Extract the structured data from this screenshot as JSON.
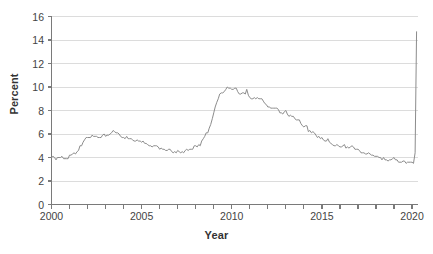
{
  "chart_data": {
    "type": "line",
    "title": "",
    "xlabel": "Year",
    "ylabel": "Percent",
    "xlim": [
      2000,
      2020.33
    ],
    "ylim": [
      0,
      16
    ],
    "ytick_values": [
      0,
      2,
      4,
      6,
      8,
      10,
      12,
      14,
      16
    ],
    "ytick_labels": [
      "0",
      "2",
      "4",
      "6",
      "8",
      "10",
      "12",
      "14",
      "16"
    ],
    "xtick_values": [
      2000,
      2001,
      2002,
      2003,
      2004,
      2005,
      2006,
      2007,
      2008,
      2009,
      2010,
      2011,
      2012,
      2013,
      2014,
      2015,
      2016,
      2017,
      2018,
      2019,
      2020
    ],
    "xtick_labels_shown": [
      "2000",
      "2005",
      "2010",
      "2015",
      "2020"
    ],
    "xtick_labels_shown_values": [
      2000,
      2005,
      2010,
      2015,
      2020
    ],
    "grid": "horizontal",
    "legend": "none",
    "line_color": "#8c8c8c",
    "axis_color": "#7a7a7a",
    "grid_color": "#dcdcdc",
    "series": [
      {
        "name": "Unemployment rate",
        "x": [
          2000.0,
          2000.08,
          2000.17,
          2000.25,
          2000.33,
          2000.42,
          2000.5,
          2000.58,
          2000.67,
          2000.75,
          2000.83,
          2000.92,
          2001.0,
          2001.08,
          2001.17,
          2001.25,
          2001.33,
          2001.42,
          2001.5,
          2001.58,
          2001.67,
          2001.75,
          2001.83,
          2001.92,
          2002.0,
          2002.08,
          2002.17,
          2002.25,
          2002.33,
          2002.42,
          2002.5,
          2002.58,
          2002.67,
          2002.75,
          2002.83,
          2002.92,
          2003.0,
          2003.08,
          2003.17,
          2003.25,
          2003.33,
          2003.42,
          2003.5,
          2003.58,
          2003.67,
          2003.75,
          2003.83,
          2003.92,
          2004.0,
          2004.08,
          2004.17,
          2004.25,
          2004.33,
          2004.42,
          2004.5,
          2004.58,
          2004.67,
          2004.75,
          2004.83,
          2004.92,
          2005.0,
          2005.08,
          2005.17,
          2005.25,
          2005.33,
          2005.42,
          2005.5,
          2005.58,
          2005.67,
          2005.75,
          2005.83,
          2005.92,
          2006.0,
          2006.08,
          2006.17,
          2006.25,
          2006.33,
          2006.42,
          2006.5,
          2006.58,
          2006.67,
          2006.75,
          2006.83,
          2006.92,
          2007.0,
          2007.08,
          2007.17,
          2007.25,
          2007.33,
          2007.42,
          2007.5,
          2007.58,
          2007.67,
          2007.75,
          2007.83,
          2007.92,
          2008.0,
          2008.08,
          2008.17,
          2008.25,
          2008.33,
          2008.42,
          2008.5,
          2008.58,
          2008.67,
          2008.75,
          2008.83,
          2008.92,
          2009.0,
          2009.08,
          2009.17,
          2009.25,
          2009.33,
          2009.42,
          2009.5,
          2009.58,
          2009.67,
          2009.75,
          2009.83,
          2009.92,
          2010.0,
          2010.08,
          2010.17,
          2010.25,
          2010.33,
          2010.42,
          2010.5,
          2010.58,
          2010.67,
          2010.75,
          2010.83,
          2010.92,
          2011.0,
          2011.08,
          2011.17,
          2011.25,
          2011.33,
          2011.42,
          2011.5,
          2011.58,
          2011.67,
          2011.75,
          2011.83,
          2011.92,
          2012.0,
          2012.08,
          2012.17,
          2012.25,
          2012.33,
          2012.42,
          2012.5,
          2012.58,
          2012.67,
          2012.75,
          2012.83,
          2012.92,
          2013.0,
          2013.08,
          2013.17,
          2013.25,
          2013.33,
          2013.42,
          2013.5,
          2013.58,
          2013.67,
          2013.75,
          2013.83,
          2013.92,
          2014.0,
          2014.08,
          2014.17,
          2014.25,
          2014.33,
          2014.42,
          2014.5,
          2014.58,
          2014.67,
          2014.75,
          2014.83,
          2014.92,
          2015.0,
          2015.08,
          2015.17,
          2015.25,
          2015.33,
          2015.42,
          2015.5,
          2015.58,
          2015.67,
          2015.75,
          2015.83,
          2015.92,
          2016.0,
          2016.08,
          2016.17,
          2016.25,
          2016.33,
          2016.42,
          2016.5,
          2016.58,
          2016.67,
          2016.75,
          2016.83,
          2016.92,
          2017.0,
          2017.08,
          2017.17,
          2017.25,
          2017.33,
          2017.42,
          2017.5,
          2017.58,
          2017.67,
          2017.75,
          2017.83,
          2017.92,
          2018.0,
          2018.08,
          2018.17,
          2018.25,
          2018.33,
          2018.42,
          2018.5,
          2018.58,
          2018.67,
          2018.75,
          2018.83,
          2018.92,
          2019.0,
          2019.08,
          2019.17,
          2019.25,
          2019.33,
          2019.42,
          2019.5,
          2019.58,
          2019.67,
          2019.75,
          2019.83,
          2019.92,
          2020.0,
          2020.08,
          2020.17,
          2020.25
        ],
        "values": [
          4.0,
          4.1,
          4.0,
          3.8,
          4.0,
          4.0,
          4.0,
          4.1,
          3.9,
          3.9,
          3.9,
          3.9,
          4.2,
          4.2,
          4.3,
          4.4,
          4.3,
          4.5,
          4.6,
          5.0,
          5.0,
          5.3,
          5.5,
          5.7,
          5.7,
          5.7,
          5.7,
          5.9,
          5.8,
          5.8,
          5.8,
          5.7,
          5.7,
          5.7,
          5.9,
          6.0,
          5.8,
          5.9,
          5.9,
          6.0,
          6.1,
          6.3,
          6.2,
          6.1,
          6.1,
          6.0,
          5.8,
          5.7,
          5.7,
          5.6,
          5.8,
          5.6,
          5.6,
          5.6,
          5.5,
          5.4,
          5.4,
          5.5,
          5.4,
          5.4,
          5.3,
          5.4,
          5.2,
          5.2,
          5.1,
          5.0,
          5.0,
          4.9,
          5.0,
          5.0,
          5.0,
          4.9,
          4.7,
          4.8,
          4.7,
          4.7,
          4.6,
          4.6,
          4.7,
          4.7,
          4.5,
          4.4,
          4.5,
          4.4,
          4.6,
          4.5,
          4.4,
          4.5,
          4.4,
          4.6,
          4.7,
          4.6,
          4.7,
          4.7,
          4.7,
          5.0,
          5.0,
          4.9,
          5.1,
          5.0,
          5.4,
          5.6,
          5.8,
          6.1,
          6.1,
          6.5,
          6.8,
          7.3,
          7.8,
          8.3,
          8.7,
          9.0,
          9.4,
          9.5,
          9.5,
          9.6,
          9.8,
          10.0,
          9.9,
          9.9,
          9.8,
          9.8,
          9.9,
          9.9,
          9.6,
          9.4,
          9.4,
          9.5,
          9.5,
          9.4,
          9.8,
          9.3,
          9.1,
          9.0,
          9.0,
          9.1,
          9.0,
          9.1,
          9.0,
          9.0,
          9.0,
          8.8,
          8.6,
          8.5,
          8.3,
          8.3,
          8.2,
          8.2,
          8.2,
          8.2,
          8.2,
          8.1,
          7.8,
          7.8,
          7.7,
          7.9,
          8.0,
          7.7,
          7.5,
          7.6,
          7.5,
          7.5,
          7.3,
          7.2,
          7.2,
          7.2,
          6.9,
          6.7,
          6.6,
          6.7,
          6.7,
          6.2,
          6.3,
          6.1,
          6.2,
          6.1,
          5.9,
          5.7,
          5.8,
          5.6,
          5.7,
          5.5,
          5.4,
          5.4,
          5.6,
          5.3,
          5.2,
          5.1,
          5.0,
          5.0,
          5.1,
          5.0,
          4.9,
          4.9,
          5.0,
          5.1,
          4.8,
          4.9,
          4.8,
          4.9,
          5.0,
          4.9,
          4.7,
          4.7,
          4.7,
          4.6,
          4.4,
          4.4,
          4.4,
          4.3,
          4.3,
          4.4,
          4.3,
          4.2,
          4.2,
          4.1,
          4.1,
          4.1,
          4.0,
          4.0,
          3.8,
          4.0,
          3.8,
          3.8,
          3.7,
          3.8,
          3.8,
          3.9,
          4.0,
          3.8,
          3.8,
          3.6,
          3.6,
          3.6,
          3.7,
          3.7,
          3.5,
          3.6,
          3.6,
          3.6,
          3.6,
          3.5,
          4.4,
          14.7
        ]
      }
    ]
  }
}
